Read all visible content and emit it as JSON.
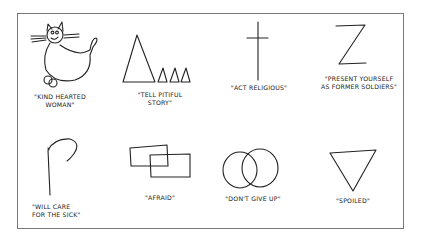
{
  "symbols": [
    {
      "icon": "cat-icon",
      "caption_lines": [
        "\"KIND HEARTED",
        "WOMAN\""
      ]
    },
    {
      "icon": "triangles-icon",
      "caption_lines": [
        "\"TELL PITIFUL",
        "STORY\""
      ]
    },
    {
      "icon": "cross-icon",
      "caption_lines": [
        "\"ACT RELIGIOUS\""
      ]
    },
    {
      "icon": "z-letter-icon",
      "caption_lines": [
        "\"PRESENT YOURSELF",
        "AS FORMER SOLDIERS\""
      ]
    },
    {
      "icon": "hook-icon",
      "caption_lines": [
        "\"WILL CARE",
        "FOR THE SICK\""
      ]
    },
    {
      "icon": "overlapping-rectangles-icon",
      "caption_lines": [
        "\"AFRAID\""
      ]
    },
    {
      "icon": "overlapping-circles-icon",
      "caption_lines": [
        "\"DON'T GIVE UP\""
      ]
    },
    {
      "icon": "inverted-triangle-icon",
      "caption_lines": [
        "\"SPOILED\""
      ]
    }
  ]
}
